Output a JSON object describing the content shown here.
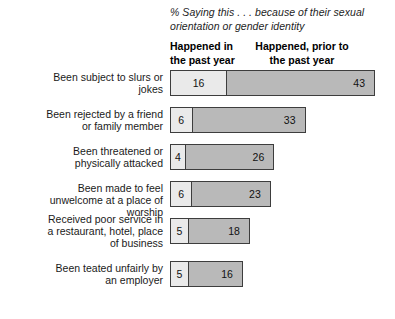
{
  "chart_data": {
    "type": "bar",
    "title": "",
    "subtitle": "% Saying this . . . because of their sexual orientation or gender identity",
    "xlabel": "",
    "ylabel": "",
    "orientation": "horizontal",
    "stacked": true,
    "grid": false,
    "legend_position": "top-as-column-headers",
    "xlim": [
      0,
      59
    ],
    "categories": [
      "Been subject to slurs or jokes",
      "Been rejected by a friend or family member",
      "Been threatened or physically attacked",
      "Been made to feel unwelcome at a place of worship",
      "Received poor service in a restaurant, hotel, place of business",
      "Been teated unfairly by an employer"
    ],
    "series": [
      {
        "name": "Happened in the past year",
        "color": "#eaeaea",
        "values": [
          16,
          6,
          4,
          6,
          5,
          5
        ]
      },
      {
        "name": "Happened, prior to the past year",
        "color": "#b9b9b9",
        "values": [
          43,
          33,
          26,
          23,
          18,
          16
        ]
      }
    ],
    "totals": [
      59,
      39,
      30,
      29,
      23,
      21
    ]
  },
  "headers": {
    "col1_line1": "Happened in",
    "col1_line2": "the past year",
    "col2_line1": "Happened, prior to",
    "col2_line2": "the past year"
  },
  "rows": [
    {
      "label_line1": "Been subject to slurs or",
      "label_line2": "jokes",
      "label_line3": "",
      "recent": "16",
      "prior": "43"
    },
    {
      "label_line1": "Been rejected by a friend",
      "label_line2": "or family member",
      "label_line3": "",
      "recent": "6",
      "prior": "33"
    },
    {
      "label_line1": "Been threatened or",
      "label_line2": "physically attacked",
      "label_line3": "",
      "recent": "4",
      "prior": "26"
    },
    {
      "label_line1": "Been made to feel",
      "label_line2": "unwelcome at a place of worship",
      "label_line3": "",
      "recent": "6",
      "prior": "23"
    },
    {
      "label_line1": "Received poor service in",
      "label_line2": "a restaurant, hotel, place",
      "label_line3": "of business",
      "recent": "5",
      "prior": "18"
    },
    {
      "label_line1": "Been teated unfairly by",
      "label_line2": "an employer",
      "label_line3": "",
      "recent": "5",
      "prior": "16"
    }
  ],
  "colors": {
    "recent_segment": "#eaeaea",
    "prior_segment": "#b9b9b9",
    "bar_border": "#3d3d3d",
    "text": "#1a1a1a",
    "background": "#ffffff"
  }
}
